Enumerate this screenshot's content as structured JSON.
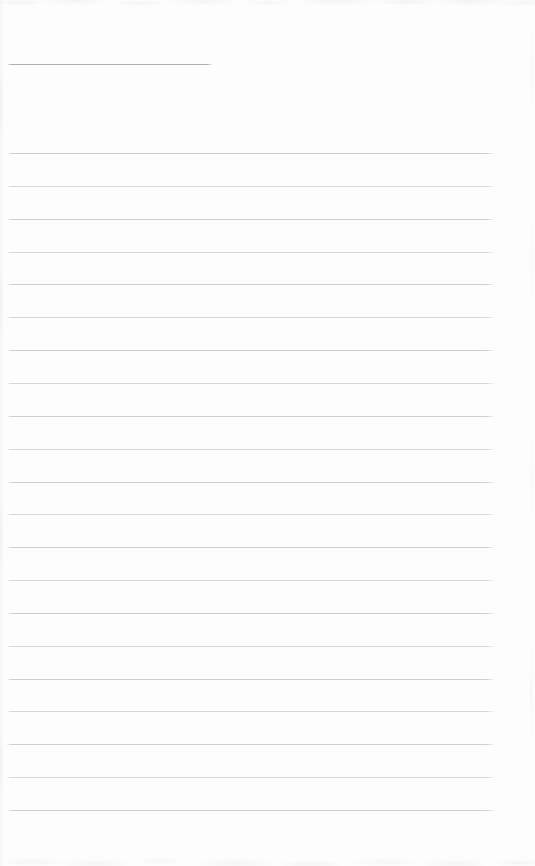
{
  "page": {
    "width": 535,
    "height": 866,
    "background": "#fdfdfd"
  },
  "ruled_lines": {
    "count": 21,
    "first_y": 153,
    "spacing": 32.85,
    "left_x": 6,
    "right_x": 496,
    "thickness": 1,
    "color": "#c6c6c8"
  },
  "partial_top_line": {
    "y": 64,
    "left_x": 7,
    "right_x": 213,
    "thickness": 1,
    "color": "#aeaeb2"
  },
  "edge_texture": {
    "top_height": 14,
    "bottom_height": 20,
    "color": "#ededee"
  }
}
